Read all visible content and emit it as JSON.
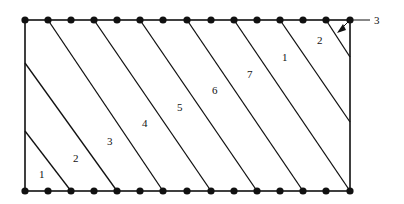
{
  "diagram": {
    "rect": {
      "x1": 25,
      "y1": 20,
      "x2": 350,
      "y2": 191
    },
    "top_nodes_x": [
      25,
      48,
      71,
      94,
      117,
      140,
      163,
      187,
      211,
      234,
      257,
      280,
      303,
      326,
      350
    ],
    "bottom_nodes_x": [
      25,
      48,
      71,
      94,
      117,
      140,
      163,
      187,
      211,
      234,
      257,
      280,
      303,
      326,
      350
    ],
    "lines": [
      {
        "x1": 25,
        "y1": 131,
        "x2": 71,
        "y2": 191
      },
      {
        "x1": 25,
        "y1": 63,
        "x2": 117,
        "y2": 191
      },
      {
        "x1": 48,
        "y1": 20,
        "x2": 163,
        "y2": 191
      },
      {
        "x1": 94,
        "y1": 20,
        "x2": 211,
        "y2": 191
      },
      {
        "x1": 140,
        "y1": 20,
        "x2": 257,
        "y2": 191
      },
      {
        "x1": 187,
        "y1": 20,
        "x2": 303,
        "y2": 191
      },
      {
        "x1": 234,
        "y1": 20,
        "x2": 350,
        "y2": 191
      },
      {
        "x1": 280,
        "y1": 20,
        "x2": 350,
        "y2": 122
      },
      {
        "x1": 326,
        "y1": 20,
        "x2": 350,
        "y2": 57
      }
    ],
    "labels": [
      {
        "text": "1",
        "x": 39,
        "y": 178
      },
      {
        "text": "2",
        "x": 73,
        "y": 162
      },
      {
        "text": "3",
        "x": 107,
        "y": 145
      },
      {
        "text": "4",
        "x": 142,
        "y": 127
      },
      {
        "text": "5",
        "x": 177,
        "y": 111
      },
      {
        "text": "6",
        "x": 212,
        "y": 94
      },
      {
        "text": "7",
        "x": 247,
        "y": 78
      },
      {
        "text": "1",
        "x": 282,
        "y": 61
      },
      {
        "text": "2",
        "x": 317,
        "y": 44
      }
    ],
    "callout": {
      "text": "3",
      "x": 377,
      "y": 22
    }
  }
}
